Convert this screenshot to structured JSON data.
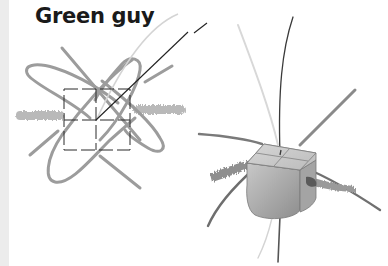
{
  "title": "Green guy",
  "colors": {
    "background": "#ffffff",
    "strip": "#ececec",
    "pencil_gray": "#9a9a9a",
    "light_gray": "#d8d8d8",
    "ink": "#2a2a2a",
    "cube_fill": "#bdbdbd"
  },
  "figures": [
    {
      "name": "flat-diagram",
      "description": "Top-down view: dashed square split into quadrants with crossing looped pencil strokes, fuzzy horizontal band, and a thin black line leaving to upper right"
    },
    {
      "name": "cube-3d",
      "description": "3D shaded cube with cross-divided top face, long curved strands radiating out and fuzzy band passing through"
    }
  ]
}
